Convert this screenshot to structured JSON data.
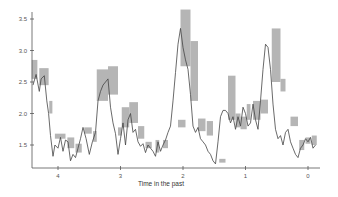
{
  "chart_data": {
    "type": "line",
    "title": "",
    "xlabel": "Time in the past",
    "ylabel": "",
    "xlim": [
      4.42,
      -0.18
    ],
    "ylim": [
      1.13,
      3.65
    ],
    "x_reversed": true,
    "grid": false,
    "legend": null,
    "x_ticks": [
      4,
      3,
      2,
      1,
      0
    ],
    "y_ticks": [
      1.5,
      2.0,
      2.5,
      3.0,
      3.5
    ],
    "colors": {
      "line": "#444444",
      "interval": "#a8a8a8",
      "axis": "#555555"
    },
    "series": [
      {
        "name": "estimate",
        "x": [
          4.4,
          4.35,
          4.3,
          4.27,
          4.22,
          4.18,
          4.15,
          4.12,
          4.08,
          4.05,
          4.0,
          3.96,
          3.92,
          3.88,
          3.84,
          3.8,
          3.76,
          3.72,
          3.68,
          3.64,
          3.6,
          3.55,
          3.5,
          3.45,
          3.4,
          3.36,
          3.32,
          3.28,
          3.24,
          3.2,
          3.16,
          3.12,
          3.08,
          3.04,
          3.0,
          2.96,
          2.92,
          2.88,
          2.84,
          2.8,
          2.76,
          2.72,
          2.68,
          2.64,
          2.6,
          2.56,
          2.52,
          2.48,
          2.44,
          2.4,
          2.36,
          2.32,
          2.28,
          2.24,
          2.2,
          2.16,
          2.12,
          2.08,
          2.04,
          2.0,
          1.96,
          1.92,
          1.88,
          1.84,
          1.8,
          1.76,
          1.72,
          1.68,
          1.64,
          1.6,
          1.56,
          1.52,
          1.48,
          1.44,
          1.4,
          1.36,
          1.32,
          1.28,
          1.24,
          1.2,
          1.16,
          1.12,
          1.08,
          1.04,
          1.0,
          0.96,
          0.92,
          0.88,
          0.84,
          0.8,
          0.76,
          0.72,
          0.68,
          0.64,
          0.6,
          0.56,
          0.52,
          0.48,
          0.44,
          0.4,
          0.36,
          0.32,
          0.28,
          0.24,
          0.2,
          0.16,
          0.12,
          0.08,
          0.04,
          0.0,
          -0.04,
          -0.08,
          -0.12
        ],
        "y": [
          2.45,
          2.62,
          2.35,
          2.55,
          2.6,
          2.2,
          2.0,
          1.65,
          1.32,
          1.5,
          1.45,
          1.62,
          1.4,
          1.58,
          1.55,
          1.25,
          1.35,
          1.3,
          1.45,
          1.6,
          1.78,
          1.6,
          1.35,
          1.55,
          1.7,
          2.2,
          2.35,
          2.45,
          2.5,
          2.55,
          2.1,
          1.85,
          1.68,
          1.35,
          1.6,
          1.85,
          1.5,
          1.9,
          2.0,
          1.7,
          1.75,
          1.55,
          1.48,
          1.52,
          1.38,
          1.5,
          1.45,
          1.4,
          1.32,
          1.55,
          1.4,
          1.5,
          1.58,
          1.7,
          1.8,
          2.2,
          2.65,
          3.1,
          3.35,
          3.05,
          2.85,
          2.7,
          2.3,
          1.8,
          1.7,
          1.78,
          1.6,
          1.55,
          1.5,
          1.4,
          1.35,
          1.25,
          1.2,
          1.55,
          1.95,
          2.05,
          2.05,
          2.0,
          1.85,
          1.95,
          1.75,
          1.95,
          1.8,
          2.1,
          2.0,
          1.8,
          1.85,
          2.15,
          1.9,
          1.75,
          2.2,
          2.7,
          3.1,
          3.05,
          2.7,
          2.15,
          1.75,
          1.6,
          1.65,
          1.5,
          1.7,
          1.75,
          1.55,
          1.45,
          1.35,
          1.3,
          1.45,
          1.5,
          1.6,
          1.55,
          1.62,
          1.45,
          1.5
        ]
      }
    ],
    "intervals": [
      {
        "x0": 4.42,
        "x1": 4.33,
        "lo": 2.55,
        "hi": 2.85
      },
      {
        "x0": 4.3,
        "x1": 4.15,
        "lo": 2.45,
        "hi": 2.72
      },
      {
        "x0": 4.14,
        "x1": 4.09,
        "lo": 2.0,
        "hi": 2.2
      },
      {
        "x0": 4.05,
        "x1": 3.88,
        "lo": 1.6,
        "hi": 1.68
      },
      {
        "x0": 3.85,
        "x1": 3.74,
        "lo": 1.45,
        "hi": 1.62
      },
      {
        "x0": 3.72,
        "x1": 3.62,
        "lo": 1.38,
        "hi": 1.52
      },
      {
        "x0": 3.58,
        "x1": 3.46,
        "lo": 1.68,
        "hi": 1.78
      },
      {
        "x0": 3.44,
        "x1": 3.38,
        "lo": 1.55,
        "hi": 1.72
      },
      {
        "x0": 3.38,
        "x1": 3.2,
        "lo": 2.2,
        "hi": 2.7
      },
      {
        "x0": 3.2,
        "x1": 3.04,
        "lo": 2.3,
        "hi": 2.75
      },
      {
        "x0": 3.04,
        "x1": 2.98,
        "lo": 1.65,
        "hi": 1.78
      },
      {
        "x0": 2.98,
        "x1": 2.86,
        "lo": 1.78,
        "hi": 2.1
      },
      {
        "x0": 2.86,
        "x1": 2.72,
        "lo": 1.85,
        "hi": 2.18
      },
      {
        "x0": 2.72,
        "x1": 2.62,
        "lo": 1.6,
        "hi": 1.8
      },
      {
        "x0": 2.6,
        "x1": 2.5,
        "lo": 1.45,
        "hi": 1.55
      },
      {
        "x0": 2.44,
        "x1": 2.38,
        "lo": 1.38,
        "hi": 1.58
      },
      {
        "x0": 2.32,
        "x1": 2.24,
        "lo": 1.45,
        "hi": 1.58
      },
      {
        "x0": 2.08,
        "x1": 1.96,
        "lo": 1.78,
        "hi": 1.9
      },
      {
        "x0": 2.04,
        "x1": 1.88,
        "lo": 2.75,
        "hi": 3.65
      },
      {
        "x0": 1.88,
        "x1": 1.76,
        "lo": 2.2,
        "hi": 3.15
      },
      {
        "x0": 1.76,
        "x1": 1.64,
        "lo": 1.72,
        "hi": 1.92
      },
      {
        "x0": 1.62,
        "x1": 1.52,
        "lo": 1.65,
        "hi": 1.88
      },
      {
        "x0": 1.42,
        "x1": 1.32,
        "lo": 1.22,
        "hi": 1.28
      },
      {
        "x0": 1.28,
        "x1": 1.16,
        "lo": 1.9,
        "hi": 2.6
      },
      {
        "x0": 1.16,
        "x1": 1.08,
        "lo": 1.78,
        "hi": 2.0
      },
      {
        "x0": 1.08,
        "x1": 0.98,
        "lo": 1.75,
        "hi": 1.95
      },
      {
        "x0": 0.98,
        "x1": 0.92,
        "lo": 1.9,
        "hi": 2.15
      },
      {
        "x0": 0.88,
        "x1": 0.76,
        "lo": 1.9,
        "hi": 2.2
      },
      {
        "x0": 0.76,
        "x1": 0.64,
        "lo": 2.0,
        "hi": 2.22
      },
      {
        "x0": 0.58,
        "x1": 0.44,
        "lo": 2.5,
        "hi": 3.35
      },
      {
        "x0": 0.44,
        "x1": 0.36,
        "lo": 2.35,
        "hi": 2.55
      },
      {
        "x0": 0.28,
        "x1": 0.16,
        "lo": 1.8,
        "hi": 1.95
      },
      {
        "x0": 0.14,
        "x1": 0.06,
        "lo": 1.42,
        "hi": 1.58
      },
      {
        "x0": 0.04,
        "x1": -0.04,
        "lo": 1.52,
        "hi": 1.62
      },
      {
        "x0": -0.06,
        "x1": -0.14,
        "lo": 1.5,
        "hi": 1.65
      }
    ]
  }
}
